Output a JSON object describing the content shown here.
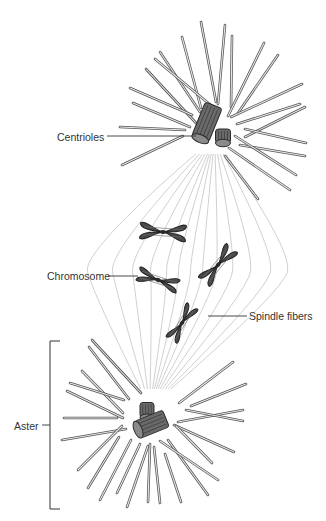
{
  "figure": {
    "colors": {
      "background": "#ffffff",
      "ray_outline": "#555555",
      "ray_fill": "#e8e8e8",
      "spindle_fiber": "#bbbbbb",
      "chromosome_fill": "#4a4a4a",
      "chromosome_outline": "#222222",
      "centriole_fill": "#6a6a6a",
      "centriole_outline": "#2a2a2a",
      "label_text": "#333333",
      "leader_line": "#333333"
    }
  },
  "labels": {
    "centrioles": {
      "text": "Centrioles",
      "x": 57,
      "y": 131,
      "line": [
        107,
        136,
        196,
        136
      ]
    },
    "chromosome": {
      "text": "Chromosome",
      "x": 47,
      "y": 270,
      "line": [
        108,
        276,
        138,
        276
      ]
    },
    "spindle_fibers": {
      "text": "Spindle fibers",
      "x": 249,
      "y": 310,
      "line": [
        208,
        316,
        247,
        316
      ]
    },
    "aster": {
      "text": "Aster",
      "x": 14,
      "y": 420,
      "line": [
        42,
        425,
        50,
        425
      ]
    }
  },
  "aster_bracket": {
    "x": 50,
    "top": 341,
    "bottom": 509,
    "tick": 60
  },
  "top_aster": {
    "rays": [
      [
        201,
        22,
        216,
        102
      ],
      [
        225,
        25,
        218,
        104
      ],
      [
        232,
        36,
        231,
        107
      ],
      [
        182,
        37,
        201,
        108
      ],
      [
        264,
        43,
        228,
        116
      ],
      [
        160,
        52,
        200,
        112
      ],
      [
        155,
        59,
        213,
        107
      ],
      [
        278,
        55,
        238,
        113
      ],
      [
        146,
        69,
        196,
        123
      ],
      [
        130,
        88,
        192,
        115
      ],
      [
        302,
        84,
        231,
        117
      ],
      [
        133,
        103,
        190,
        127
      ],
      [
        300,
        104,
        237,
        124
      ],
      [
        305,
        107,
        245,
        137
      ],
      [
        120,
        127,
        185,
        130
      ],
      [
        245,
        129,
        306,
        143
      ],
      [
        240,
        145,
        305,
        156
      ],
      [
        122,
        165,
        183,
        136
      ],
      [
        235,
        136,
        296,
        175
      ],
      [
        229,
        148,
        290,
        190
      ],
      [
        225,
        156,
        258,
        199
      ]
    ],
    "centrioles": [
      {
        "cx": 207,
        "cy": 122,
        "w": 18,
        "h": 36,
        "angle": 22
      },
      {
        "cx": 223,
        "cy": 136,
        "w": 15,
        "h": 14,
        "angle": 0
      }
    ]
  },
  "bottom_aster": {
    "rays": [
      [
        92,
        340,
        141,
        393
      ],
      [
        89,
        347,
        129,
        399
      ],
      [
        82,
        371,
        123,
        413
      ],
      [
        70,
        383,
        124,
        400
      ],
      [
        67,
        391,
        123,
        418
      ],
      [
        64,
        418,
        117,
        418
      ],
      [
        62,
        440,
        126,
        429
      ],
      [
        122,
        426,
        78,
        470
      ],
      [
        119,
        437,
        88,
        488
      ],
      [
        131,
        440,
        100,
        500
      ],
      [
        140,
        444,
        117,
        493
      ],
      [
        148,
        446,
        127,
        507
      ],
      [
        150,
        444,
        148,
        502
      ],
      [
        154,
        447,
        160,
        503
      ],
      [
        165,
        454,
        181,
        502
      ],
      [
        168,
        440,
        208,
        495
      ],
      [
        160,
        441,
        218,
        480
      ],
      [
        174,
        425,
        234,
        452
      ],
      [
        176,
        426,
        212,
        463
      ],
      [
        233,
        362,
        179,
        403
      ],
      [
        246,
        384,
        191,
        406
      ],
      [
        243,
        410,
        178,
        422
      ],
      [
        243,
        421,
        186,
        410
      ]
    ],
    "centrioles": [
      {
        "cx": 147,
        "cy": 410,
        "w": 14,
        "h": 15,
        "angle": 0
      },
      {
        "cx": 152,
        "cy": 424,
        "w": 18,
        "h": 30,
        "angle": 68
      }
    ]
  },
  "spindle": {
    "top": [
      210,
      148
    ],
    "bottom": [
      155,
      395
    ],
    "bulge": [
      -95,
      -70,
      -50,
      -32,
      -16,
      -4,
      8,
      20,
      34,
      50,
      68,
      88,
      105
    ]
  },
  "chromosomes": [
    {
      "cx": 163,
      "cy": 232,
      "length": 46,
      "width": 17,
      "angle": 4
    },
    {
      "cx": 218,
      "cy": 265,
      "length": 44,
      "width": 16,
      "angle": -50
    },
    {
      "cx": 158,
      "cy": 280,
      "length": 42,
      "width": 15,
      "angle": 18
    },
    {
      "cx": 182,
      "cy": 323,
      "length": 40,
      "width": 14,
      "angle": -58
    }
  ]
}
